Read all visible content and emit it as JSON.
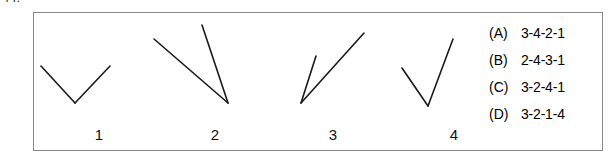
{
  "question": {
    "number": "44."
  },
  "panel": {
    "border_color": "#8a8a8a",
    "background": "#ffffff"
  },
  "figures": {
    "stroke_color": "#1a1a1a",
    "stroke_width": 1.6,
    "items": [
      {
        "label": "1",
        "label_x": 65,
        "label_y": 122,
        "vertex": [
          41,
          90
        ],
        "arm1_end": [
          7,
          53
        ],
        "arm2_end": [
          76,
          53
        ],
        "description": "wide-v-angle"
      },
      {
        "label": "2",
        "label_x": 181,
        "label_y": 122,
        "vertex": [
          194,
          90
        ],
        "arm1_end": [
          120,
          26
        ],
        "arm2_end": [
          168,
          12
        ],
        "description": "narrow-angle-vertex-bottom-right"
      },
      {
        "label": "3",
        "label_x": 299,
        "label_y": 122,
        "vertex": [
          267,
          90
        ],
        "arm1_end": [
          282,
          43
        ],
        "arm2_end": [
          330,
          20
        ],
        "description": "very-narrow-angle-vertex-bottom-left"
      },
      {
        "label": "4",
        "label_x": 420,
        "label_y": 122,
        "vertex": [
          394,
          93
        ],
        "arm1_end": [
          368,
          55
        ],
        "arm2_end": [
          419,
          26
        ],
        "description": "narrow-v-angle"
      }
    ]
  },
  "answers": {
    "options": [
      {
        "key": "(A)",
        "value": "3-4-2-1"
      },
      {
        "key": "(B)",
        "value": "2-4-3-1"
      },
      {
        "key": "(C)",
        "value": "3-2-4-1"
      },
      {
        "key": "(D)",
        "value": "3-2-1-4"
      }
    ]
  }
}
